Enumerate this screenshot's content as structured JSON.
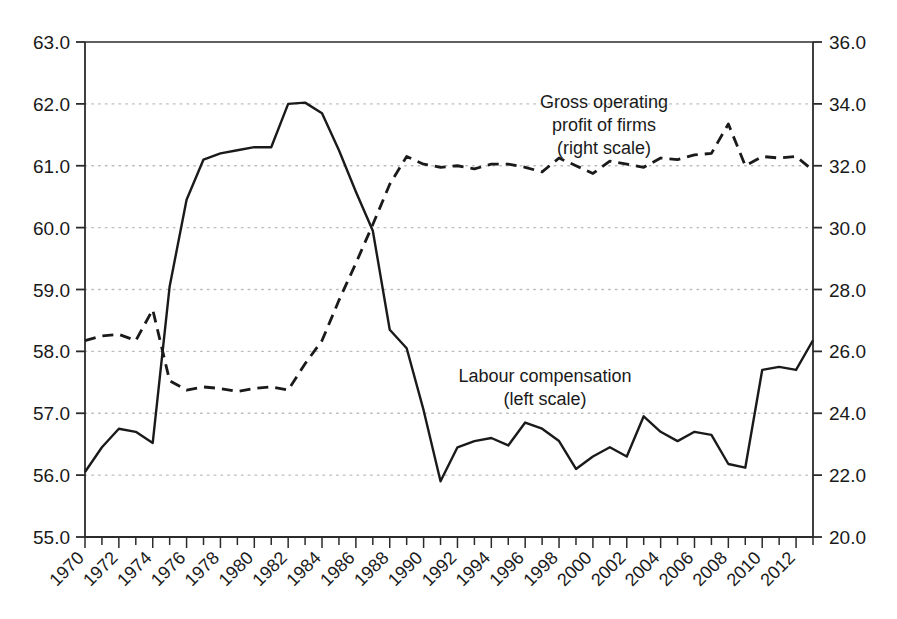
{
  "chart_data": {
    "type": "line",
    "title": "",
    "xlabel": "",
    "ylabel": "",
    "grid": true,
    "legend_position": "in-plot-annotations",
    "x": [
      1970,
      1971,
      1972,
      1973,
      1974,
      1975,
      1976,
      1977,
      1978,
      1979,
      1980,
      1981,
      1982,
      1983,
      1984,
      1985,
      1986,
      1987,
      1988,
      1989,
      1990,
      1991,
      1992,
      1993,
      1994,
      1995,
      1996,
      1997,
      1998,
      1999,
      2000,
      2001,
      2002,
      2003,
      2004,
      2005,
      2006,
      2007,
      2008,
      2009,
      2010,
      2011,
      2012,
      2013
    ],
    "x_axis": {
      "min": 1970,
      "max": 2013,
      "tick_labels": [
        "1970",
        "1972",
        "1974",
        "1976",
        "1978",
        "1980",
        "1982",
        "1984",
        "1986",
        "1988",
        "1990",
        "1992",
        "1994",
        "1996",
        "1998",
        "2000",
        "2002",
        "2004",
        "2006",
        "2008",
        "2010",
        "2012"
      ],
      "tick_label_years": [
        1970,
        1972,
        1974,
        1976,
        1978,
        1980,
        1982,
        1984,
        1986,
        1988,
        1990,
        1992,
        1994,
        1996,
        1998,
        2000,
        2002,
        2004,
        2006,
        2008,
        2010,
        2012
      ],
      "minor_tick_years": [
        1971,
        1973,
        1975,
        1977,
        1979,
        1981,
        1983,
        1985,
        1987,
        1989,
        1991,
        1993,
        1995,
        1997,
        1999,
        2001,
        2003,
        2005,
        2007,
        2009,
        2011,
        2013
      ],
      "label_rotation_deg": -45
    },
    "left_axis": {
      "min": 55.0,
      "max": 63.0,
      "step": 1.0,
      "tick_labels": [
        "55.0",
        "56.0",
        "57.0",
        "58.0",
        "59.0",
        "60.0",
        "61.0",
        "62.0",
        "63.0"
      ],
      "tick_values": [
        55.0,
        56.0,
        57.0,
        58.0,
        59.0,
        60.0,
        61.0,
        62.0,
        63.0
      ]
    },
    "right_axis": {
      "min": 20.0,
      "max": 36.0,
      "step": 2.0,
      "tick_labels": [
        "20.0",
        "22.0",
        "24.0",
        "26.0",
        "28.0",
        "30.0",
        "32.0",
        "34.0",
        "36.0"
      ],
      "tick_values": [
        20.0,
        22.0,
        24.0,
        26.0,
        28.0,
        30.0,
        32.0,
        34.0,
        36.0
      ]
    },
    "series": [
      {
        "name": "Labour compensation",
        "axis": "left",
        "style": "solid",
        "color": "#1a1a1a",
        "values": [
          56.05,
          56.45,
          56.75,
          56.7,
          56.52,
          59.05,
          60.45,
          61.1,
          61.2,
          61.25,
          61.3,
          61.3,
          62.0,
          62.02,
          61.85,
          61.25,
          60.58,
          59.95,
          58.35,
          58.05,
          57.05,
          55.9,
          56.45,
          56.55,
          56.6,
          56.48,
          56.85,
          56.75,
          56.55,
          56.1,
          56.3,
          56.45,
          56.3,
          56.95,
          56.7,
          56.55,
          56.7,
          56.65,
          56.18,
          56.12,
          57.7,
          57.75,
          57.7,
          58.18
        ]
      },
      {
        "name": "Gross operating profit of firms",
        "axis": "right",
        "style": "dashed",
        "color": "#1a1a1a",
        "values": [
          26.35,
          26.5,
          26.55,
          26.35,
          27.35,
          25.05,
          24.75,
          24.85,
          24.8,
          24.7,
          24.8,
          24.85,
          24.75,
          25.6,
          26.35,
          27.65,
          28.85,
          30.1,
          31.4,
          32.3,
          32.05,
          31.95,
          32.0,
          31.9,
          32.05,
          32.05,
          31.95,
          31.8,
          32.25,
          32.0,
          31.75,
          32.15,
          32.05,
          31.95,
          32.25,
          32.2,
          32.35,
          32.4,
          33.35,
          32.0,
          32.3,
          32.25,
          32.3,
          31.85
        ]
      }
    ],
    "annotations": [
      {
        "name": "gross-operating-profit-label",
        "lines": [
          "Gross operating",
          "profit of firms",
          "(right scale)"
        ],
        "x_px": 604,
        "y_px": 108
      },
      {
        "name": "labour-compensation-label",
        "lines": [
          "Labour compensation",
          "(left scale)"
        ],
        "x_px": 545,
        "y_px": 382
      }
    ]
  },
  "colors": {
    "line": "#1a1a1a",
    "axis": "#2b2b2b",
    "grid": "#bdbdbd",
    "background": "#ffffff"
  }
}
